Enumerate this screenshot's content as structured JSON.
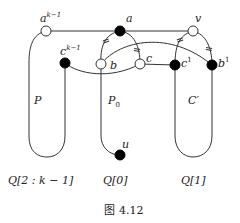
{
  "figure": {
    "caption_prefix": "图",
    "caption_number": "4.12"
  },
  "nodes": {
    "a_k1": {
      "base": "a",
      "sup": "k−1",
      "style": "open"
    },
    "a": {
      "base": "a",
      "sup": "",
      "style": "filled"
    },
    "v": {
      "base": "v",
      "sup": "",
      "style": "open"
    },
    "c_k1": {
      "base": "c",
      "sup": "k−1",
      "style": "filled"
    },
    "b": {
      "base": "b",
      "sup": "",
      "style": "open"
    },
    "c": {
      "base": "c",
      "sup": "",
      "style": "open"
    },
    "c1": {
      "base": "c",
      "sup": "1",
      "style": "filled"
    },
    "b1": {
      "base": "b",
      "sup": "1",
      "style": "filled"
    },
    "u": {
      "base": "u",
      "sup": "",
      "style": "filled"
    }
  },
  "regions": {
    "P": "P",
    "P0_base": "P",
    "P0_sub": "0",
    "Cprime": "C′"
  },
  "columns": {
    "left": "Q[2 : k − 1]",
    "middle": "Q[0]",
    "right": "Q[1]"
  },
  "edge_marks": {
    "symbol": "="
  }
}
